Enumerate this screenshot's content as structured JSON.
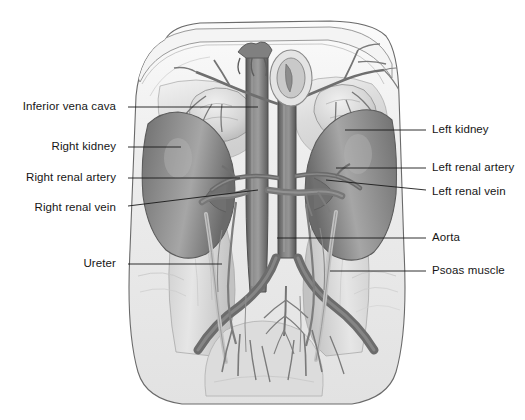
{
  "figure": {
    "view": "anterior",
    "style": "grayscale medical illustration",
    "caption": "",
    "palette": {
      "background": "#ffffff",
      "leader_line": "#1a1a1a",
      "label_text": "#161616",
      "kidney": "#8a8a8a",
      "kidney_shadow": "#6d6d6d",
      "vessel": "#7f7f7f",
      "vessel_dark": "#5f5f5f",
      "fascia": "#d8d8d8",
      "muscle": "#c9c9c9",
      "outline": "#5a5a5a"
    }
  },
  "labels": {
    "left": [
      {
        "id": "inferior-vena-cava",
        "text": "Inferior vena cava",
        "text_x": 122,
        "text_y": 107,
        "leader_x1": 128,
        "leader_y1": 107,
        "leader_x2": 258,
        "leader_y2": 107
      },
      {
        "id": "right-kidney",
        "text": "Right kidney",
        "text_x": 122,
        "text_y": 147,
        "leader_x1": 128,
        "leader_y1": 147,
        "leader_x2": 181,
        "leader_y2": 147
      },
      {
        "id": "right-renal-artery",
        "text": "Right renal artery",
        "text_x": 122,
        "text_y": 178,
        "leader_x1": 128,
        "leader_y1": 178,
        "leader_x2": 240,
        "leader_y2": 178
      },
      {
        "id": "right-renal-vein",
        "text": "Right renal vein",
        "text_x": 122,
        "text_y": 208,
        "leader_x1": 128,
        "leader_y1": 206,
        "leader_x2": 258,
        "leader_y2": 190
      },
      {
        "id": "ureter",
        "text": "Ureter",
        "text_x": 122,
        "text_y": 264,
        "leader_x1": 128,
        "leader_y1": 264,
        "leader_x2": 222,
        "leader_y2": 264
      }
    ],
    "right": [
      {
        "id": "left-kidney",
        "text": "Left kidney",
        "text_x": 432,
        "text_y": 130,
        "leader_x1": 426,
        "leader_y1": 130,
        "leader_x2": 345,
        "leader_y2": 130
      },
      {
        "id": "left-renal-artery",
        "text": "Left renal artery",
        "text_x": 432,
        "text_y": 168,
        "leader_x1": 426,
        "leader_y1": 168,
        "leader_x2": 336,
        "leader_y2": 168
      },
      {
        "id": "left-renal-vein",
        "text": "Left renal vein",
        "text_x": 432,
        "text_y": 192,
        "leader_x1": 426,
        "leader_y1": 190,
        "leader_x2": 326,
        "leader_y2": 180
      },
      {
        "id": "aorta",
        "text": "Aorta",
        "text_x": 432,
        "text_y": 238,
        "leader_x1": 426,
        "leader_y1": 238,
        "leader_x2": 277,
        "leader_y2": 238
      },
      {
        "id": "psoas-muscle",
        "text": "Psoas muscle",
        "text_x": 432,
        "text_y": 271,
        "leader_x1": 426,
        "leader_y1": 271,
        "leader_x2": 330,
        "leader_y2": 271
      }
    ]
  }
}
